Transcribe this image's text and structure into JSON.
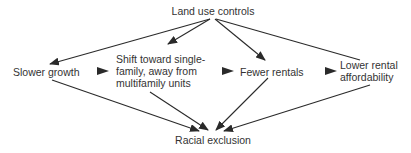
{
  "diagram": {
    "type": "flow-diagram",
    "nodes": {
      "land_use_controls": {
        "label": "Land use controls"
      },
      "slower_growth": {
        "label": "Slower growth"
      },
      "shift_single_family": {
        "line1": "Shift toward single-",
        "line2": "family, away from",
        "line3": "multifamily units"
      },
      "fewer_rentals": {
        "label": "Fewer rentals"
      },
      "lower_rental_affordability": {
        "line1": "Lower rental",
        "line2": "affordability"
      },
      "racial_exclusion": {
        "label": "Racial exclusion"
      }
    },
    "edges": [
      {
        "from": "Land use controls",
        "to": "Slower growth"
      },
      {
        "from": "Land use controls",
        "to": "Shift toward single-family, away from multifamily units"
      },
      {
        "from": "Land use controls",
        "to": "Fewer rentals"
      },
      {
        "from": "Land use controls",
        "to": "Lower rental affordability"
      },
      {
        "from": "Slower growth",
        "to": "Shift toward single-family, away from multifamily units"
      },
      {
        "from": "Shift toward single-family, away from multifamily units",
        "to": "Fewer rentals"
      },
      {
        "from": "Fewer rentals",
        "to": "Lower rental affordability"
      },
      {
        "from": "Slower growth",
        "to": "Racial exclusion"
      },
      {
        "from": "Shift toward single-family, away from multifamily units",
        "to": "Racial exclusion"
      },
      {
        "from": "Fewer rentals",
        "to": "Racial exclusion"
      },
      {
        "from": "Lower rental affordability",
        "to": "Racial exclusion"
      }
    ],
    "colors": {
      "line": "#2a2a2a",
      "text": "#333333",
      "background": "#ffffff"
    }
  }
}
